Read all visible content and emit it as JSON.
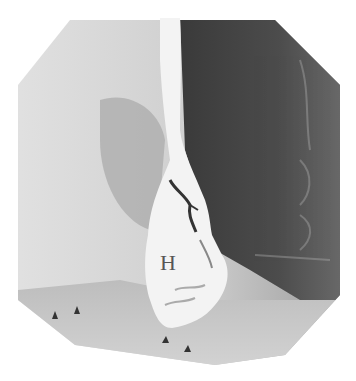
{
  "figure": {
    "type": "radiograph",
    "labels": [
      {
        "text": "H",
        "x": 168,
        "y": 270
      }
    ],
    "arrowheads": [
      {
        "x": 55,
        "y": 316
      },
      {
        "x": 77,
        "y": 311
      },
      {
        "x": 165,
        "y": 341
      },
      {
        "x": 187,
        "y": 350
      }
    ],
    "colors": {
      "background": "#ffffff",
      "field_light": "#d8d8d8",
      "field_dark": "#4a4a4a",
      "barium": "#f4f4f4",
      "arrowhead": "#333333"
    }
  }
}
